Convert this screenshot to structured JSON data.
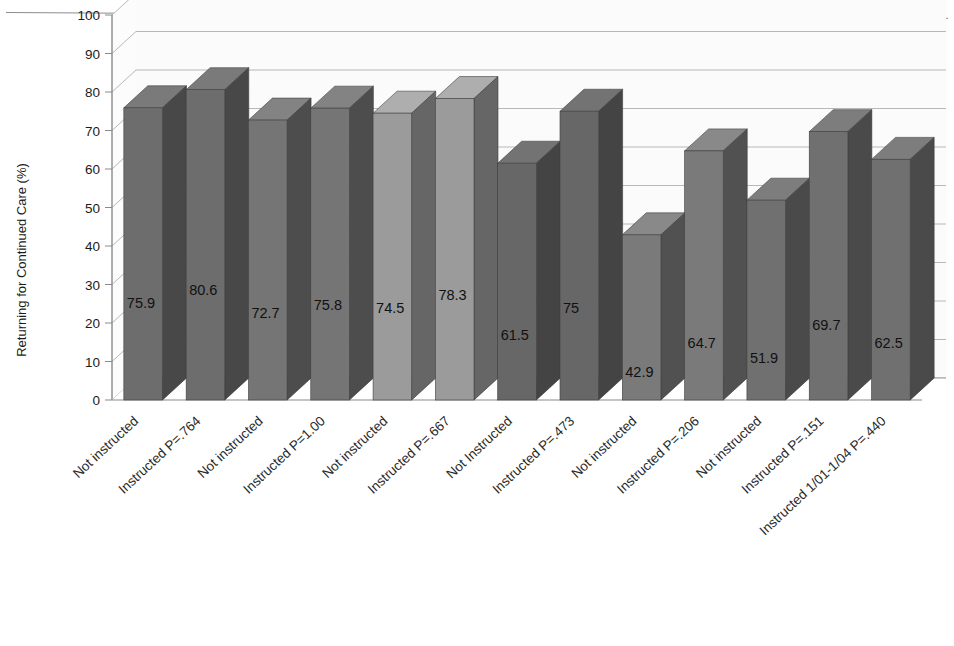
{
  "chart_data": {
    "type": "bar",
    "title": "",
    "xlabel": "",
    "ylabel": "Returning for Continued Care (%)",
    "ylim": [
      0,
      100
    ],
    "ytick_step": 10,
    "yticks": [
      "0",
      "10",
      "20",
      "30",
      "40",
      "50",
      "60",
      "70",
      "80",
      "90",
      "100"
    ],
    "grid": true,
    "legend_position": "top-center",
    "three_d": true,
    "categories": [
      "Not instructed",
      "Instructed P=.764",
      "Not instructed",
      "Instructed P=1.00",
      "Not instructed",
      "Instructed P=.667",
      "Not Instructed",
      "Instructed P=.473",
      "Not instructed",
      "Instructed P=.206",
      "Not instructed",
      "Instructed P=.151",
      "Instructed 1/01-1/04 P=.440"
    ],
    "values": [
      75.9,
      80.6,
      72.7,
      75.8,
      74.5,
      78.3,
      61.5,
      75,
      42.9,
      64.7,
      51.9,
      69.7,
      62.5
    ],
    "value_labels": [
      "75.9",
      "80.6",
      "72.7",
      "75.8",
      "74.5",
      "78.3",
      "61.5",
      "75",
      "42.9",
      "64.7",
      "51.9",
      "69.7",
      "62.5"
    ],
    "series_of_bar": [
      "FU Females",
      "FU Females",
      "FU Males",
      "FU Males",
      "FU Total",
      "FU Total",
      "NP Females",
      "NP Females",
      "NP Males",
      "NP Males",
      "NP Total",
      "NP Total",
      "NP Total"
    ],
    "bar_colors": [
      "#6d6d6d",
      "#6d6d6d",
      "#757575",
      "#757575",
      "#9b9b9b",
      "#9b9b9b",
      "#676767",
      "#676767",
      "#7a7a7a",
      "#7a7a7a",
      "#707070",
      "#707070",
      "#707070"
    ],
    "legend": [
      {
        "label": "FU Females",
        "color": "#6d6d6d"
      },
      {
        "label": "FU Males",
        "color": "#757575"
      },
      {
        "label": "FU Total",
        "color": "#a5a5a5"
      },
      {
        "label": "NP Females",
        "color": "#676767"
      },
      {
        "label": "NP Males",
        "color": "#7a7a7a"
      },
      {
        "label": "NP Total",
        "color": "#707070"
      }
    ]
  },
  "colors": {
    "background": "#ffffff",
    "plot_area": "#fbfbfb",
    "gridline": "#b8b8b8",
    "axis": "#8a8a8a",
    "floor": "#9a9a9a",
    "bar_side": "#4f4f4f",
    "bar_top": "#585858",
    "text": "#1b1b1b"
  }
}
